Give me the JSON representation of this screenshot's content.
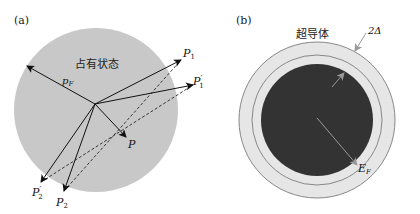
{
  "panels": [
    {
      "id": "a",
      "label": "(a)",
      "region_label": "占有状态",
      "radius_label": "pF",
      "points": {
        "P1": {
          "main": "P",
          "sub": "1",
          "prime": ""
        },
        "P1p": {
          "main": "P",
          "sub": "1",
          "prime": "′"
        },
        "P": {
          "main": "P",
          "sub": "",
          "prime": ""
        },
        "P2": {
          "main": "P",
          "sub": "2",
          "prime": ""
        },
        "P2p": {
          "main": "P",
          "sub": "2",
          "prime": "′"
        }
      },
      "colors": {
        "sphere": "#c8c8c8",
        "arrow": "#111111"
      }
    },
    {
      "id": "b",
      "label": "(b)",
      "region_label": "超导体",
      "gap_label": "2Δ",
      "fermi_label": "E",
      "fermi_sub": "F",
      "colors": {
        "core": "#333333",
        "shell": "#e6e6e6",
        "ring": "#888888"
      }
    }
  ]
}
